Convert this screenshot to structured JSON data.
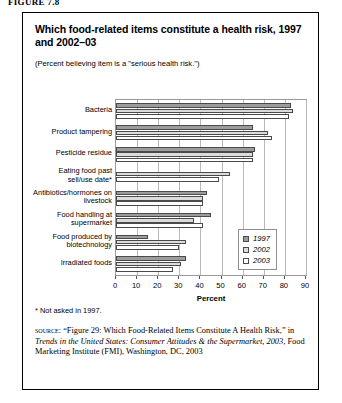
{
  "figure_label": "FIGURE 7.8",
  "title": "Which food-related items constitute a health risk, 1997 and 2002–03",
  "subtitle": "(Percent believing item is a \"serious health risk.\")",
  "footnote": "* Not asked in 1997.",
  "source": {
    "kicker": "source:",
    "part1": " “Figure 29: Which Food-Related Items Constitute A Health Risk,” in ",
    "italic": "Trends in the United States: Consumer Attitudes & the Supermarket, 2003",
    "part2": ", Food Marketing Institute (FMI), Washington, DC, 2003"
  },
  "legend": {
    "items": [
      {
        "label": "1997",
        "color": "#9c9c9c"
      },
      {
        "label": "2002",
        "color": "#dcdcdc"
      },
      {
        "label": "2003",
        "color": "#ffffff"
      }
    ]
  },
  "chart_data": {
    "type": "bar",
    "orientation": "horizontal",
    "title": "Which food-related items constitute a health risk, 1997 and 2002–03",
    "subtitle": "(Percent believing item is a \"serious health risk.\")",
    "xlabel": "Percent",
    "ylabel": "",
    "xlim": [
      0,
      90
    ],
    "xticks": [
      0,
      10,
      20,
      30,
      40,
      50,
      60,
      70,
      80,
      90
    ],
    "grid": true,
    "legend_position": "inside-right",
    "categories": [
      "Bacteria",
      "Product tampering",
      "Pesticide residue",
      "Eating food past sell/use date*",
      "Antibiotics/hormones on livestock",
      "Food handling at supermarket",
      "Food produced by biotechnology",
      "Irradiated foods"
    ],
    "category_lines": [
      [
        "Bacteria"
      ],
      [
        "Product tampering"
      ],
      [
        "Pesticide residue"
      ],
      [
        "Eating food past",
        "sell/use date*"
      ],
      [
        "Antibiotics/hormones on",
        "livestock"
      ],
      [
        "Food handling at",
        "supermarket"
      ],
      [
        "Food produced by",
        "biotechnology"
      ],
      [
        "Irradiated foods"
      ]
    ],
    "series": [
      {
        "name": "1997",
        "color": "#9c9c9c",
        "values": [
          83,
          65,
          66,
          null,
          43,
          45,
          15,
          33
        ]
      },
      {
        "name": "2002",
        "color": "#dcdcdc",
        "values": [
          84,
          72,
          65,
          54,
          41,
          37,
          33,
          31
        ]
      },
      {
        "name": "2003",
        "color": "#ffffff",
        "values": [
          82,
          74,
          65,
          49,
          41,
          41,
          30,
          27
        ]
      }
    ]
  }
}
